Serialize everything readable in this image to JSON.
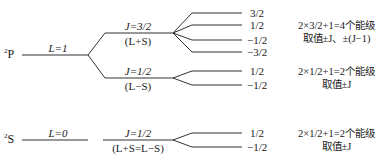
{
  "diagram": {
    "type": "energy-level-splitting",
    "terms": [
      {
        "id": "2P",
        "label_sup": "2",
        "label_main": "P",
        "L_label": "L=1",
        "levels": [
          {
            "J_label": "J=3/2",
            "J_sub": "(L+S)",
            "mj": [
              "3/2",
              "1/2",
              "−1/2",
              "−3/2"
            ],
            "note_line1": "2×3/2+1=4个能级",
            "note_line2": "取值±J、±(J−1)"
          },
          {
            "J_label": "J=1/2",
            "J_sub": "(L−S)",
            "mj": [
              "1/2",
              "−1/2"
            ],
            "note_line1": "2×1/2+1=2个能级",
            "note_line2": "取值±J"
          }
        ]
      },
      {
        "id": "2S",
        "label_sup": "2",
        "label_main": "S",
        "L_label": "L=0",
        "levels": [
          {
            "J_label": "J=1/2",
            "J_sub": "(L+S=L−S)",
            "mj": [
              "1/2",
              "−1/2"
            ],
            "note_line1": "2×1/2+1=2个能级",
            "note_line2": "取值±J"
          }
        ]
      }
    ],
    "colors": {
      "line": "#333333",
      "text": "#1a1a1a"
    }
  }
}
